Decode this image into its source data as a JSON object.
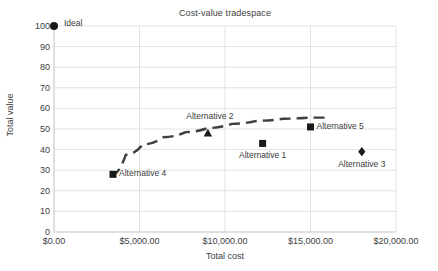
{
  "chart_data": {
    "type": "scatter",
    "title": "Cost-value tradespace",
    "xlabel": "Total cost",
    "ylabel": "Total value",
    "xlim": [
      0,
      20000
    ],
    "ylim": [
      0,
      100
    ],
    "grid": true,
    "legend": "none",
    "x_ticks": [
      "$0.00",
      "$5,000.00",
      "$10,000.00",
      "$15,000.00",
      "$20,000.00"
    ],
    "x_tick_values": [
      0,
      5000,
      10000,
      15000,
      20000
    ],
    "y_ticks": [
      "0",
      "10",
      "20",
      "30",
      "40",
      "50",
      "60",
      "70",
      "80",
      "90",
      "100"
    ],
    "y_tick_values": [
      0,
      10,
      20,
      30,
      40,
      50,
      60,
      70,
      80,
      90,
      100
    ],
    "points": [
      {
        "name": "Ideal",
        "x": 0,
        "y": 100,
        "marker": "circle",
        "label": "Ideal",
        "label_pos": "right"
      },
      {
        "name": "Alternative 4",
        "x": 3450,
        "y": 28,
        "marker": "square",
        "label": "Alternative 4",
        "label_pos": "right"
      },
      {
        "name": "Alternative 2",
        "x": 9000,
        "y": 48,
        "marker": "triangle",
        "label": "Alternative 2",
        "label_pos": "above-left"
      },
      {
        "name": "Alternative 1",
        "x": 12200,
        "y": 43,
        "marker": "square",
        "label": "Alternative 1",
        "label_pos": "below"
      },
      {
        "name": "Alternative 5",
        "x": 15000,
        "y": 51,
        "marker": "square",
        "label": "Alternative 5",
        "label_pos": "right"
      },
      {
        "name": "Alternative 3",
        "x": 18000,
        "y": 39,
        "marker": "diamond",
        "label": "Alternative 3",
        "label_pos": "below"
      }
    ],
    "frontier": {
      "name": "Pareto frontier",
      "style": "dashed",
      "color": "#404040",
      "x": [
        3350,
        4200,
        5200,
        6400,
        7700,
        9000,
        10400,
        11900,
        13400,
        14900,
        15900
      ],
      "y": [
        27.5,
        37.5,
        42.5,
        46.0,
        48.5,
        50.5,
        52.5,
        54.0,
        55.0,
        55.5,
        55.5
      ]
    },
    "colors": {
      "marker": "#1a1a1a",
      "frontier": "#404040",
      "grid": "#e2e2e2",
      "axis": "#cfcfcf",
      "text": "#404040"
    }
  }
}
